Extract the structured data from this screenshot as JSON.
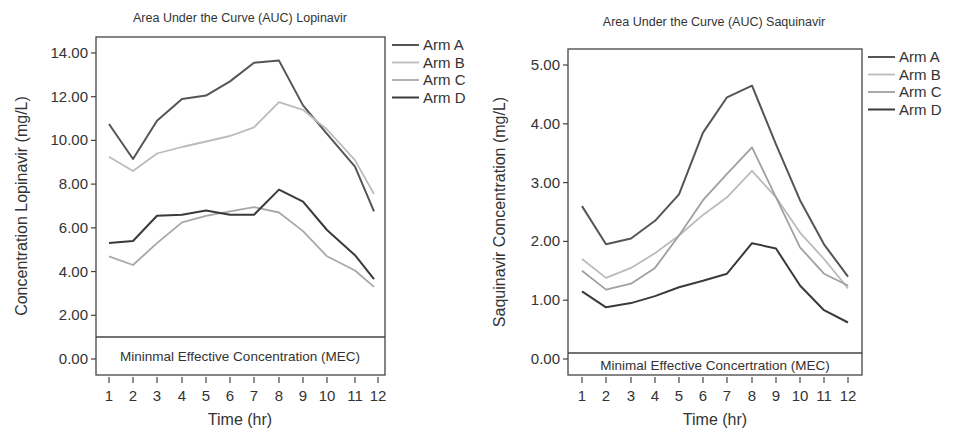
{
  "chart_data": [
    {
      "type": "line",
      "title": "Area Under the Curve (AUC) Lopinavir",
      "xlabel": "Time (hr)",
      "ylabel": "Concentration Lopinavir (mg/L)",
      "x": [
        1,
        2,
        3,
        4,
        5,
        6,
        7,
        8,
        9,
        10,
        11,
        12
      ],
      "xticks": [
        "1",
        "2",
        "3",
        "4",
        "5",
        "6",
        "7",
        "8",
        "9",
        "10",
        "11",
        "12"
      ],
      "yticks": [
        "0.00",
        "2.00",
        "4.00",
        "6.00",
        "8.00",
        "10.00",
        "12.00",
        "14.00"
      ],
      "ylim": [
        -0.8,
        14.8
      ],
      "grid": false,
      "legend_position": "right",
      "annotation": {
        "text": "Mininmal Effective Concentration (MEC)",
        "y_threshold": 1.0
      },
      "series": [
        {
          "name": "Arm A",
          "color": "#555555",
          "width": 2.0,
          "values": [
            10.75,
            9.15,
            10.9,
            11.9,
            12.05,
            12.7,
            13.55,
            13.65,
            11.6,
            10.3,
            8.8,
            6.75
          ]
        },
        {
          "name": "Arm B",
          "color": "#bbbbbb",
          "width": 1.8,
          "values": [
            9.25,
            8.6,
            9.4,
            9.7,
            9.95,
            10.2,
            10.6,
            11.75,
            11.4,
            10.5,
            9.1,
            7.55
          ]
        },
        {
          "name": "Arm C",
          "color": "#a8a8a8",
          "width": 1.8,
          "values": [
            4.7,
            4.3,
            5.3,
            6.25,
            6.55,
            6.75,
            6.95,
            6.7,
            5.85,
            4.7,
            4.05,
            3.3
          ]
        },
        {
          "name": "Arm D",
          "color": "#3a3a3a",
          "width": 2.0,
          "values": [
            5.3,
            5.4,
            6.55,
            6.6,
            6.8,
            6.6,
            6.6,
            7.75,
            7.2,
            5.9,
            4.75,
            3.65
          ]
        }
      ]
    },
    {
      "type": "line",
      "title": "Area Under the Curve (AUC) Saquinavir",
      "xlabel": "Time (hr)",
      "ylabel": "Saquinavir Concentration (mg/L)",
      "x": [
        1,
        2,
        3,
        4,
        5,
        6,
        7,
        8,
        9,
        10,
        11,
        12
      ],
      "xticks": [
        "1",
        "2",
        "3",
        "4",
        "5",
        "6",
        "7",
        "8",
        "9",
        "10",
        "11",
        "12"
      ],
      "yticks": [
        "0.00",
        "1.00",
        "2.00",
        "3.00",
        "4.00",
        "5.00"
      ],
      "ylim": [
        -0.27,
        5.27
      ],
      "grid": false,
      "legend_position": "right",
      "annotation": {
        "text": "Minimal Effective Concertration (MEC)",
        "y_threshold": 0.1
      },
      "series": [
        {
          "name": "Arm A",
          "color": "#555555",
          "width": 2.0,
          "values": [
            2.6,
            1.95,
            2.05,
            2.35,
            2.8,
            3.85,
            4.45,
            4.65,
            3.65,
            2.7,
            1.95,
            1.4
          ]
        },
        {
          "name": "Arm B",
          "color": "#bbbbbb",
          "width": 1.8,
          "values": [
            1.7,
            1.38,
            1.55,
            1.8,
            2.1,
            2.45,
            2.75,
            3.2,
            2.75,
            2.15,
            1.7,
            1.2
          ]
        },
        {
          "name": "Arm C",
          "color": "#a0a0a0",
          "width": 1.8,
          "values": [
            1.5,
            1.18,
            1.28,
            1.55,
            2.1,
            2.7,
            3.15,
            3.6,
            2.75,
            1.9,
            1.45,
            1.25
          ]
        },
        {
          "name": "Arm D",
          "color": "#3a3a3a",
          "width": 2.0,
          "values": [
            1.15,
            0.88,
            0.95,
            1.07,
            1.22,
            1.33,
            1.45,
            1.97,
            1.88,
            1.25,
            0.83,
            0.62
          ]
        }
      ]
    }
  ],
  "charts": [
    {
      "title": "Area Under the Curve (AUC) Lopinavir",
      "xlabel": "Time (hr)",
      "ylabel": "Concentration Lopinavir (mg/L)",
      "mec_label": "Mininmal Effective Concentration (MEC)",
      "legend": [
        "Arm A",
        "Arm B",
        "Arm C",
        "Arm D"
      ]
    },
    {
      "title": "Area Under the Curve (AUC) Saquinavir",
      "xlabel": "Time (hr)",
      "ylabel": "Saquinavir Concentration (mg/L)",
      "mec_label": "Minimal Effective Concertration (MEC)",
      "legend": [
        "Arm A",
        "Arm B",
        "Arm C",
        "Arm D"
      ]
    }
  ]
}
